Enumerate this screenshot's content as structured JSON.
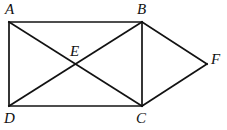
{
  "figure": {
    "type": "geometry-diagram",
    "canvas": {
      "width": 227,
      "height": 130,
      "background": "#ffffff"
    },
    "stroke": {
      "color": "#121212",
      "width": 1.7
    },
    "points": {
      "A": {
        "label": "A",
        "x": 9,
        "y": 22,
        "label_x": 5,
        "label_y": 2
      },
      "B": {
        "label": "B",
        "x": 142,
        "y": 22,
        "label_x": 137,
        "label_y": 2
      },
      "C": {
        "label": "C",
        "x": 142,
        "y": 106,
        "label_x": 136,
        "label_y": 111
      },
      "D": {
        "label": "D",
        "x": 9,
        "y": 106,
        "label_x": 4,
        "label_y": 111
      },
      "E": {
        "label": "E",
        "x": 75.5,
        "y": 64,
        "label_x": 70,
        "label_y": 44
      },
      "F": {
        "label": "F",
        "x": 207,
        "y": 64,
        "label_x": 211,
        "label_y": 52
      }
    },
    "segments": [
      {
        "name": "AB",
        "from": "A",
        "to": "B"
      },
      {
        "name": "BC",
        "from": "B",
        "to": "C"
      },
      {
        "name": "CD",
        "from": "C",
        "to": "D"
      },
      {
        "name": "DA",
        "from": "D",
        "to": "A"
      },
      {
        "name": "AC",
        "from": "A",
        "to": "C"
      },
      {
        "name": "DB",
        "from": "D",
        "to": "B"
      },
      {
        "name": "BF",
        "from": "B",
        "to": "F"
      },
      {
        "name": "CF",
        "from": "C",
        "to": "F"
      }
    ],
    "labels": [
      "A",
      "B",
      "E",
      "F",
      "D",
      "C"
    ]
  }
}
